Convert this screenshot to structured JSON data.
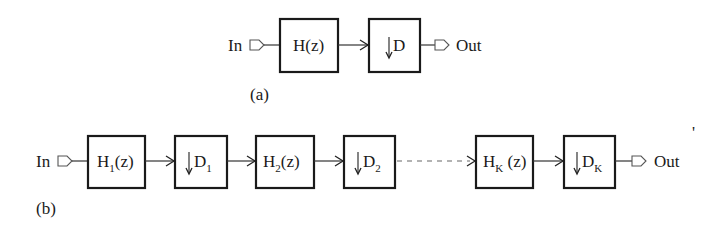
{
  "diagram_a": {
    "caption": "(a)",
    "input_label": "In",
    "output_label": "Out",
    "filter": {
      "name": "H",
      "subscript": "",
      "arg": "(z)"
    },
    "decimator": {
      "symbol": "↓",
      "name": "D",
      "subscript": ""
    }
  },
  "diagram_b": {
    "caption": "(b)",
    "input_label": "In",
    "output_label": "Out",
    "stages": [
      {
        "filter": {
          "name": "H",
          "subscript": "1",
          "arg": "(z)"
        },
        "decimator": {
          "symbol": "↓",
          "name": "D",
          "subscript": "1"
        }
      },
      {
        "filter": {
          "name": "H",
          "subscript": "2",
          "arg": "(z)"
        },
        "decimator": {
          "symbol": "↓",
          "name": "D",
          "subscript": "2"
        }
      },
      {
        "filter": {
          "name": "H",
          "subscript": "K",
          "arg": " (z)"
        },
        "decimator": {
          "symbol": "↓",
          "name": "D",
          "subscript": "K"
        }
      }
    ],
    "ellipsis_connector": "dashed"
  },
  "stray_mark": "'"
}
